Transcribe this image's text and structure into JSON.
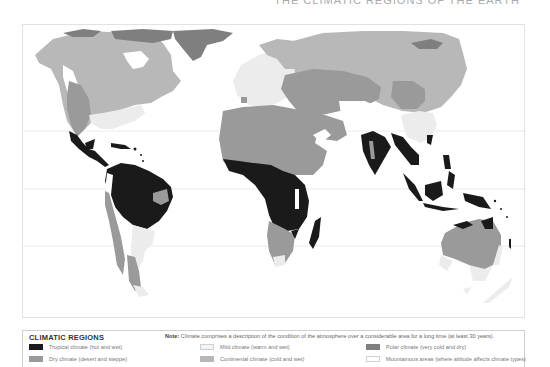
{
  "header": {
    "title_cut": "THE CLIMATIC REGIONS OF THE EARTH"
  },
  "colors": {
    "tropical": "#1a1a1a",
    "dry": "#9a9a9a",
    "mild": "#ececec",
    "continental": "#b8b8b8",
    "polar": "#7f7f7f",
    "mountainous": "#ffffff",
    "gridline": "#e4e4e4"
  },
  "map": {
    "gridlines": [
      "Tropic of Cancer",
      "Equator",
      "Tropic of Capricorn"
    ]
  },
  "legend": {
    "title": "CLIMATIC REGIONS",
    "note_label": "Note:",
    "note_text": " Climate comprises a description of the condition of the atmosphere over a considerable area for a long time (at least 30 years).",
    "items": [
      {
        "label": "Tropical climate (hot and wet)",
        "color": "#1a1a1a"
      },
      {
        "label": "Dry climate (desert and steppe)",
        "color": "#9a9a9a"
      },
      {
        "label": "Mild climate (warm and wet)",
        "color": "#ececec"
      },
      {
        "label": "Continental climate (cold and wet)",
        "color": "#b8b8b8"
      },
      {
        "label": "Polar climate (very cold and dry)",
        "color": "#7f7f7f"
      },
      {
        "label": "Mountainous areas (where altitude affects climate types)",
        "color": "#ffffff"
      }
    ]
  }
}
